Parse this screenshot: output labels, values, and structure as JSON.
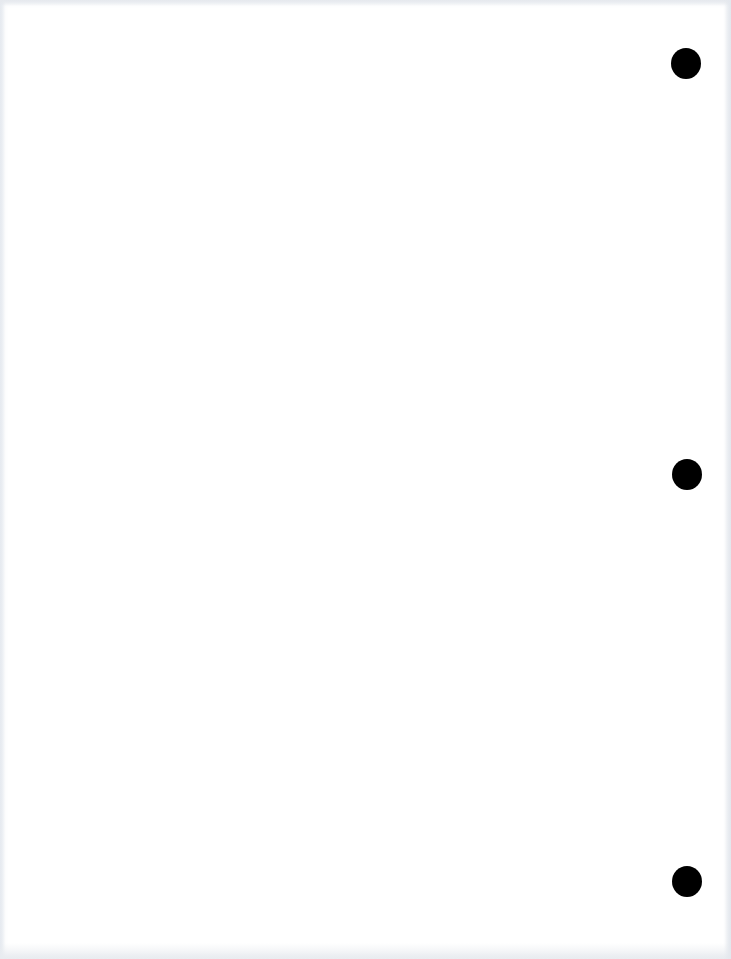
{
  "page": {
    "type": "blank scanned page",
    "background_color": "#ffffff",
    "text": []
  },
  "punch_holes": [
    {
      "name": "top",
      "cx": 686,
      "cy": 64,
      "color": "#000000"
    },
    {
      "name": "middle",
      "cx": 687,
      "cy": 475,
      "color": "#000000"
    },
    {
      "name": "bottom",
      "cx": 687,
      "cy": 882,
      "color": "#000000"
    }
  ]
}
